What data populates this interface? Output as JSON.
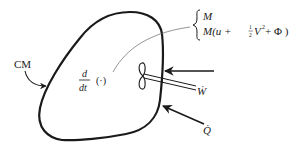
{
  "diagram": {
    "type": "control-mass energy balance schematic",
    "labels": {
      "system": "CM",
      "rate_operator_num": "d",
      "rate_operator_den": "dt",
      "rate_operator_arg": "(·)",
      "brace_line1": "M",
      "brace_line2_prefix": "M(u + ",
      "brace_line2_frac_num": "1",
      "brace_line2_frac_den": "2",
      "brace_line2_suffix": "V",
      "brace_line2_exp": "2",
      "brace_line2_tail": " + Φ )",
      "work_rate": "Ẇ",
      "heat_rate": "Q̇"
    },
    "elements": [
      {
        "id": "control-mass-boundary",
        "shape": "closed blob"
      },
      {
        "id": "cm-pointer-arrow",
        "from": "CM label",
        "to": "boundary"
      },
      {
        "id": "leader-line",
        "from": "d/dt (·)",
        "to": "brace"
      },
      {
        "id": "paddle-wheel",
        "shape": "propeller on shaft"
      },
      {
        "id": "work-arrow",
        "direction": "inward"
      },
      {
        "id": "heat-arrow",
        "direction": "inward"
      }
    ],
    "colors": {
      "ink": "#1a1a1a",
      "leader": "#666666",
      "background": "#ffffff"
    }
  }
}
